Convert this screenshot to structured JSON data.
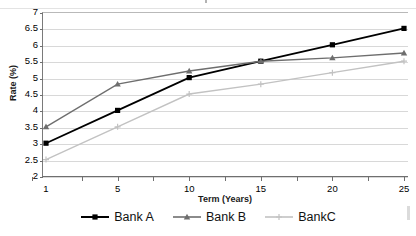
{
  "chart_data": {
    "type": "line",
    "title": "",
    "xlabel": "Term (Years)",
    "ylabel": "Rate (%)",
    "categories": [
      "1",
      "5",
      "10",
      "15",
      "20",
      "25"
    ],
    "x": [
      1,
      5,
      10,
      15,
      20,
      25
    ],
    "ylim": [
      2,
      7
    ],
    "ytick_step": 0.5,
    "yticks": [
      "7",
      "6.5",
      "6",
      "5.5",
      "5",
      "4.5",
      "4",
      "3.5",
      "3",
      "2.5",
      "2"
    ],
    "grid": "horizontal",
    "legend_position": "bottom",
    "series": [
      {
        "name": "Bank A",
        "color": "#000000",
        "marker": "square",
        "values": [
          3.0,
          4.0,
          5.0,
          5.5,
          6.0,
          6.5
        ]
      },
      {
        "name": "Bank B",
        "color": "#6e6e6e",
        "marker": "triangle",
        "values": [
          3.5,
          4.8,
          5.2,
          5.5,
          5.6,
          5.75
        ]
      },
      {
        "name": "BankC",
        "color": "#c2c2c2",
        "marker": "plus",
        "values": [
          2.5,
          3.5,
          4.5,
          4.8,
          5.15,
          5.5
        ]
      }
    ]
  },
  "axes": {
    "y_title": "Rate (%)",
    "x_title": "Term (Years)"
  },
  "legend": {
    "items": [
      {
        "label": "Bank A"
      },
      {
        "label": "Bank B"
      },
      {
        "label": "BankC"
      }
    ]
  }
}
